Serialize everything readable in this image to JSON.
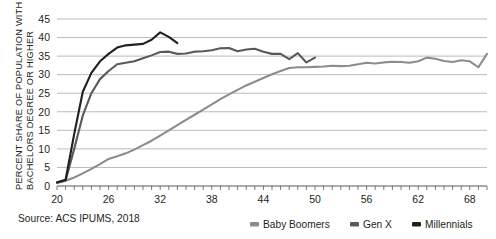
{
  "chart_data": {
    "type": "line",
    "title": "",
    "xlabel": "",
    "ylabel": "PERCENT SHARE OF POPULATION WITH BACHELORS DEGREE OR HIGHER",
    "ylabel_line1": "PERCENT SHARE OF POPULATION WITH",
    "ylabel_line2": "BACHELORS DEGREE OR HIGHER",
    "xlim": [
      20,
      70
    ],
    "ylim": [
      0,
      45
    ],
    "ytick_step": 5,
    "yticks": [
      0,
      5,
      10,
      15,
      20,
      25,
      30,
      35,
      40,
      45
    ],
    "xticks_labeled": [
      20,
      26,
      32,
      38,
      44,
      50,
      56,
      62,
      68
    ],
    "xtick_minor_step": 1,
    "grid": "horizontal",
    "legend_position": "bottom-right",
    "source": "Source: ACS IPUMS, 2018",
    "series": [
      {
        "name": "Baby Boomers",
        "color": "#8c8c8c",
        "x": [
          20,
          21,
          22,
          23,
          24,
          25,
          26,
          27,
          28,
          29,
          30,
          31,
          32,
          33,
          34,
          35,
          36,
          37,
          38,
          39,
          40,
          41,
          42,
          43,
          44,
          45,
          46,
          47,
          48,
          49,
          50,
          51,
          52,
          53,
          54,
          55,
          56,
          57,
          58,
          59,
          60,
          61,
          62,
          63,
          64,
          65,
          66,
          67,
          68,
          69,
          70
        ],
        "values": [
          0.8,
          1.4,
          2.3,
          3.4,
          4.6,
          5.9,
          7.3,
          8.0,
          8.8,
          9.8,
          11.0,
          12.2,
          13.6,
          15.0,
          16.4,
          17.8,
          19.2,
          20.6,
          22.0,
          23.4,
          24.7,
          25.9,
          27.1,
          28.1,
          29.1,
          30.1,
          31.0,
          31.8,
          32.0,
          32.0,
          32.1,
          32.2,
          32.4,
          32.3,
          32.4,
          32.8,
          33.2,
          33.0,
          33.3,
          33.5,
          33.4,
          33.2,
          33.6,
          34.6,
          34.3,
          33.7,
          33.4,
          33.9,
          33.6,
          32.0,
          35.6
        ]
      },
      {
        "name": "Gen X",
        "color": "#595959",
        "x": [
          20,
          21,
          22,
          23,
          24,
          25,
          26,
          27,
          28,
          29,
          30,
          31,
          32,
          33,
          34,
          35,
          36,
          37,
          38,
          39,
          40,
          41,
          42,
          43,
          44,
          45,
          46,
          47,
          48,
          49,
          50
        ],
        "values": [
          0.9,
          1.5,
          10.0,
          19.0,
          25.0,
          28.8,
          31.0,
          32.8,
          33.2,
          33.6,
          34.4,
          35.2,
          36.1,
          36.2,
          35.6,
          35.7,
          36.2,
          36.3,
          36.6,
          37.1,
          37.2,
          36.3,
          36.8,
          37.0,
          36.2,
          35.6,
          35.6,
          34.2,
          35.8,
          33.3,
          34.6
        ]
      },
      {
        "name": "Millennials",
        "color": "#231f20",
        "x": [
          20,
          21,
          22,
          23,
          24,
          25,
          26,
          27,
          28,
          29,
          30,
          31,
          32,
          33,
          34
        ],
        "values": [
          1.0,
          1.7,
          14.0,
          25.4,
          30.5,
          33.6,
          35.6,
          37.3,
          37.9,
          38.1,
          38.3,
          39.4,
          41.4,
          40.2,
          38.5
        ]
      }
    ]
  },
  "legend": {
    "items": [
      {
        "label": "Baby Boomers",
        "color": "#8c8c8c"
      },
      {
        "label": "Gen X",
        "color": "#595959"
      },
      {
        "label": "Millennials",
        "color": "#231f20"
      }
    ]
  },
  "source": {
    "text": "Source: ACS IPUMS, 2018"
  },
  "axes": {
    "y_title_line1": "PERCENT SHARE OF POPULATION WITH",
    "y_title_line2": "BACHELORS DEGREE OR HIGHER"
  }
}
